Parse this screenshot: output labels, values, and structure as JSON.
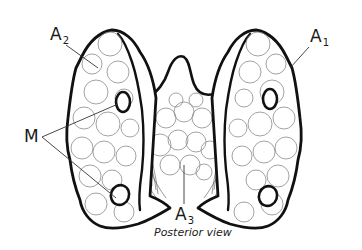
{
  "figure": {
    "view_caption": "Posterior view",
    "labels": {
      "a1": {
        "main": "A",
        "sub": "1"
      },
      "a2": {
        "main": "A",
        "sub": "2"
      },
      "a3": {
        "main": "A",
        "sub": "3"
      },
      "m": {
        "main": "M"
      }
    },
    "colors": {
      "outline": "#111111",
      "detail": "#8a8a8a",
      "background": "#ffffff"
    }
  }
}
